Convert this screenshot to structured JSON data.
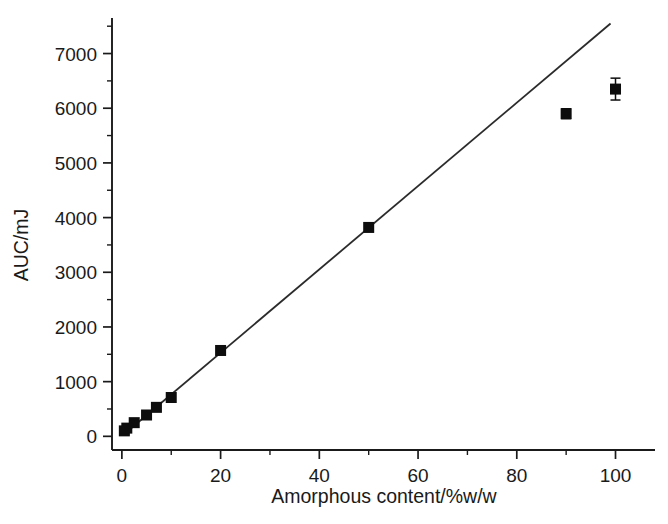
{
  "chart_data": {
    "type": "scatter",
    "title": "",
    "subtitle": "",
    "xlabel": "Amorphous content/%w/w",
    "ylabel": "AUC/mJ",
    "xlim": [
      -2,
      108
    ],
    "ylim": [
      -250,
      7650
    ],
    "xticks": [
      0,
      20,
      40,
      60,
      80,
      100
    ],
    "yticks": [
      0,
      1000,
      2000,
      3000,
      4000,
      5000,
      6000,
      7000
    ],
    "xticklabels": [
      "0",
      "20",
      "40",
      "60",
      "80",
      "100"
    ],
    "yticklabels": [
      "0",
      "1000",
      "2000",
      "3000",
      "4000",
      "5000",
      "6000",
      "7000"
    ],
    "xminorticks": [
      10,
      30,
      50,
      70,
      90
    ],
    "yminorticks": [
      500,
      1500,
      2500,
      3500,
      4500,
      5500,
      6500,
      7500
    ],
    "grid": false,
    "legend": false,
    "legend_position": "none",
    "marker_style": "filled-square",
    "marker_color": "#0d0d0d",
    "line_color": "#2b2b2b",
    "background_color": "#ffffff",
    "axis_color": "#1a1a1a",
    "series": [
      {
        "name": "AUC measurements",
        "x": [
          0.5,
          1,
          2.5,
          5,
          7,
          10,
          20,
          50,
          90,
          100
        ],
        "y": [
          100,
          150,
          250,
          390,
          530,
          710,
          1570,
          3820,
          5900,
          6350
        ],
        "yerr": [
          60,
          0,
          0,
          0,
          0,
          0,
          0,
          0,
          90,
          200
        ]
      }
    ],
    "fit_line": {
      "name": "linear fit",
      "x": [
        0.2,
        99
      ],
      "y": [
        20,
        7550
      ],
      "slope": 76,
      "intercept": 5
    },
    "annotations": []
  }
}
